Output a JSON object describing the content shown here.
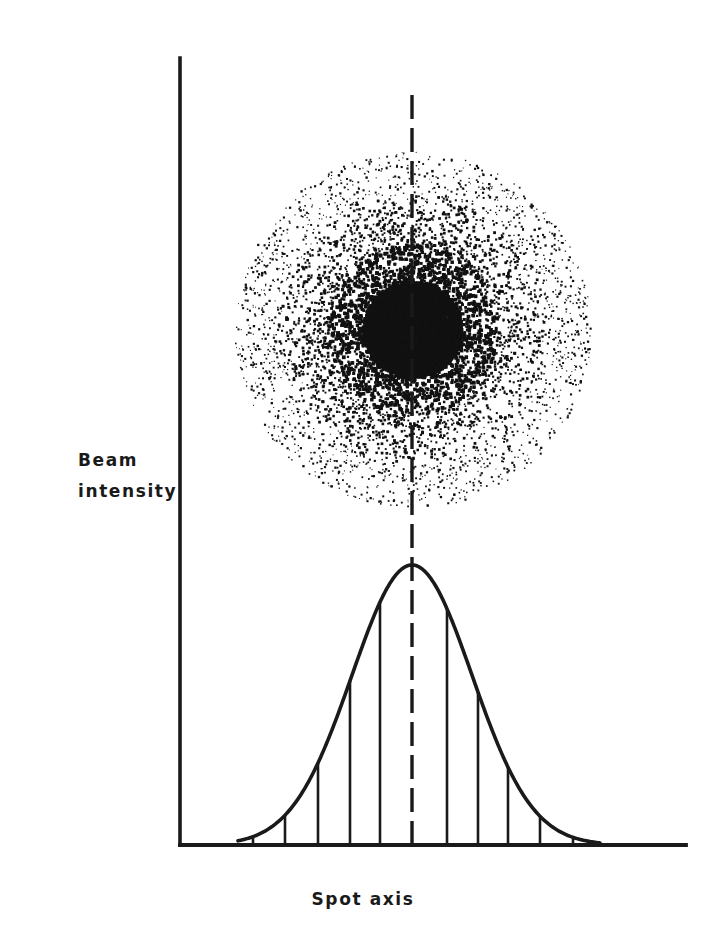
{
  "figure": {
    "width": 726,
    "height": 944,
    "background": "#ffffff",
    "ink_color": "#1a1a1a"
  },
  "labels": {
    "y_axis_line1": "Beam",
    "y_axis_line2": "intensity",
    "x_axis": "Spot axis"
  },
  "chart_data": {
    "type": "line",
    "title": "",
    "subtitle": "",
    "xlabel": "Spot axis",
    "ylabel": "Beam intensity",
    "grid": false,
    "legend": null,
    "annotations": [
      {
        "name": "beam-spot-scatter",
        "kind": "scatter-cloud",
        "description": "Radially symmetric beam spot: dense saturated core with diffuse halo of discrete dots, density decreasing with radius",
        "center_x": 413,
        "center_y": 330,
        "core_radius": 45,
        "halo_radius": 178,
        "point_count": 6200,
        "dot_color": "#111111"
      },
      {
        "name": "spot-axis-centerline",
        "kind": "dashed-vertical-line",
        "x": 412,
        "y_top": 95,
        "y_bottom": 845,
        "dash": 24,
        "gap": 9
      }
    ],
    "axes": {
      "x_axis_y_px": 845,
      "x_axis_x_start_px": 180,
      "x_axis_x_end_px": 686,
      "y_axis_x_px": 180,
      "y_axis_y_top_px": 58,
      "y_axis_y_bottom_px": 845,
      "xlim": [
        180,
        686
      ],
      "ylim": [
        0,
        1
      ],
      "ticks_x": [],
      "ticks_y": []
    },
    "profile": {
      "name": "Gaussian beam intensity profile",
      "shape": "gaussian",
      "peak_x_px": 412,
      "peak_y_px": 565,
      "baseline_y_px": 845,
      "amplitude_px": 280,
      "sigma_px": 60,
      "x_start_px": 238,
      "x_end_px": 600,
      "x": [
        238,
        253,
        268,
        285,
        300,
        318,
        333,
        350,
        365,
        380,
        396,
        412,
        428,
        443,
        458,
        475,
        490,
        508,
        523,
        540,
        555,
        573,
        588,
        600
      ],
      "y_normalized": [
        0.051,
        0.092,
        0.151,
        0.235,
        0.323,
        0.433,
        0.533,
        0.637,
        0.74,
        0.831,
        0.936,
        1.0,
        0.964,
        0.879,
        0.779,
        0.652,
        0.541,
        0.412,
        0.317,
        0.228,
        0.164,
        0.104,
        0.068,
        0.051
      ]
    },
    "hatching": {
      "name": "vertical-fill-hatch",
      "description": "Evenly spaced vertical lines from the x-axis baseline up to the Gaussian curve",
      "spacing_px": 32,
      "x_positions": [
        253,
        285,
        318,
        350,
        380,
        447,
        478,
        508,
        540,
        573
      ]
    }
  }
}
